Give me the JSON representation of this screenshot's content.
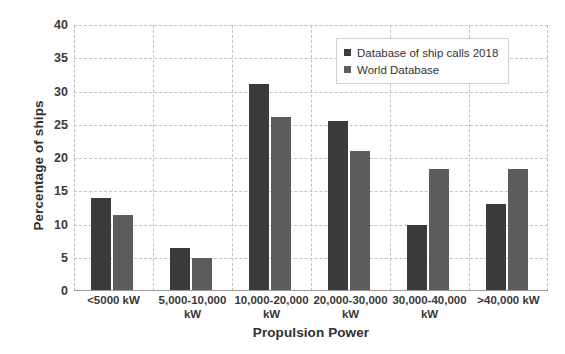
{
  "chart_data": {
    "type": "bar",
    "title": "",
    "xlabel": "Propulsion Power",
    "ylabel": "Percentage of ships",
    "categories": [
      "<5000 kW",
      "5,000-10,000\nkW",
      "10,000-20,000\nkW",
      "20,000-30,000\nkW",
      "30,000-40,000\nkW",
      ">40,000 kW"
    ],
    "series": [
      {
        "name": "Database of ship calls 2018",
        "color": "#3b3b3b",
        "values": [
          14.0,
          6.5,
          31.2,
          25.5,
          9.9,
          13.1
        ]
      },
      {
        "name": "World Database",
        "color": "#5c5c5c",
        "values": [
          11.5,
          5.0,
          26.1,
          21.0,
          18.4,
          18.4
        ]
      }
    ],
    "ylim": [
      0,
      40
    ],
    "yticks": [
      0,
      5,
      10,
      15,
      20,
      25,
      30,
      35,
      40
    ],
    "ytick_labels": [
      "0",
      "5",
      "10",
      "15",
      "20",
      "25",
      "30",
      "35",
      "40"
    ],
    "grid": true,
    "legend_position": "top-right"
  }
}
